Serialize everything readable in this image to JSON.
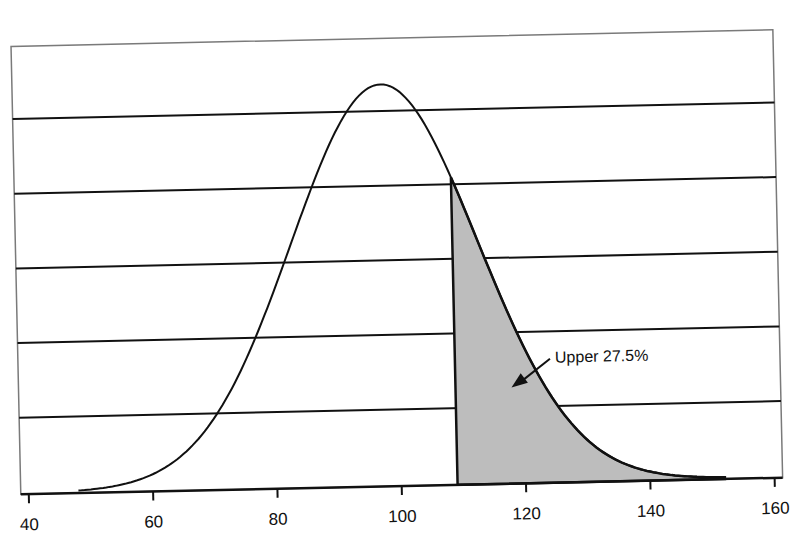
{
  "chart_data": {
    "type": "area",
    "title": "",
    "xlabel": "",
    "ylabel": "",
    "distribution": {
      "family": "normal",
      "mean": 98,
      "sd": 15
    },
    "x_ticks": [
      40,
      60,
      80,
      100,
      120,
      140,
      160
    ],
    "xlim": [
      40,
      160
    ],
    "y_ticks_shown": false,
    "grid": {
      "horizontal": true,
      "count": 5
    },
    "curve_range": [
      48,
      152
    ],
    "shaded_region": {
      "from": 109,
      "to": 152,
      "fill": "#bdbdbd",
      "label": "Upper 27.5%",
      "percent": 27.5
    },
    "annotation": {
      "text": "Upper 27.5%",
      "arrow_target_x": 118,
      "arrow": true
    },
    "legend": null
  },
  "colors": {
    "background": "#ffffff",
    "frame": "#7a7a7a",
    "gridline": "#111111",
    "curve": "#111111",
    "shade": "#bdbdbd"
  }
}
